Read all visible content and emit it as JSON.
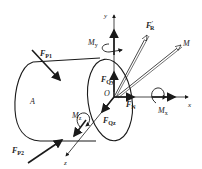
{
  "diagram": {
    "type": "free-body diagram",
    "labels": {
      "body": "A",
      "origin": "O",
      "axis_x": "x",
      "axis_y": "y",
      "axis_z": "z",
      "fp1": "F",
      "fp1_sub": "P1",
      "fp2": "F",
      "fp2_sub": "P2",
      "fr": "F",
      "fr_sub": "R",
      "fr_prime": "'",
      "moment_total": "M",
      "my": "M",
      "my_sub": "y",
      "mx": "M",
      "mx_sub": "x",
      "mz": "M",
      "mz_sub": "z",
      "fqy": "F",
      "fqy_sub": "Qy",
      "fqz": "F",
      "fqz_sub": "Qz",
      "fn": "F",
      "fn_sub": "N"
    },
    "colors": {
      "line": "#1a1a1a",
      "text": "#222222",
      "background": "#ffffff"
    }
  }
}
